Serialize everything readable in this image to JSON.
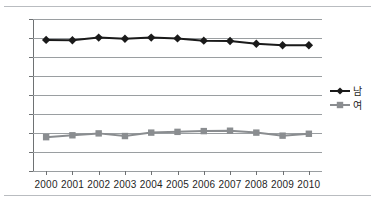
{
  "chart_data": {
    "type": "line",
    "title": "",
    "subtitle": "",
    "xlabel": "",
    "ylabel": "",
    "categories": [
      "2000",
      "2001",
      "2002",
      "2003",
      "2004",
      "2005",
      "2006",
      "2007",
      "2008",
      "2009",
      "2010"
    ],
    "x": [
      2000,
      2001,
      2002,
      2003,
      2004,
      2005,
      2006,
      2007,
      2008,
      2009,
      2010
    ],
    "ylim": [
      40,
      80
    ],
    "ytick_values": [
      40,
      45,
      50,
      55,
      60,
      65,
      70,
      75,
      80
    ],
    "ytick_labels": [
      "40",
      "45",
      "50",
      "55",
      "60",
      "65",
      "70",
      "75",
      "80"
    ],
    "ytick_step": 5,
    "grid": true,
    "grid_axis": "y",
    "legend_position": "right",
    "series": [
      {
        "name": "남",
        "marker": "diamond",
        "color": "#1a1a1a",
        "line_width": 2,
        "values": [
          74.5,
          74.4,
          75.1,
          74.8,
          75.1,
          74.9,
          74.3,
          74.2,
          73.5,
          73.1,
          73.1
        ]
      },
      {
        "name": "여",
        "marker": "square",
        "color": "#8a8d90",
        "line_width": 2,
        "values": [
          48.9,
          49.4,
          49.9,
          49.2,
          50.1,
          50.3,
          50.5,
          50.6,
          50.1,
          49.3,
          49.8
        ]
      }
    ],
    "annotations": []
  },
  "legend": {
    "items": [
      {
        "label": "남",
        "marker": "diamond-marker",
        "color": "#1a1a1a"
      },
      {
        "label": "여",
        "marker": "square-marker",
        "color": "#8a8d90"
      }
    ]
  },
  "colors": {
    "series_male": "#1a1a1a",
    "series_female": "#8a8d90",
    "gridline": "#9a9ea1",
    "axis": "#6e7173",
    "rule": "#b9bcc0",
    "text": "#1f1f1f",
    "background": "#ffffff"
  }
}
